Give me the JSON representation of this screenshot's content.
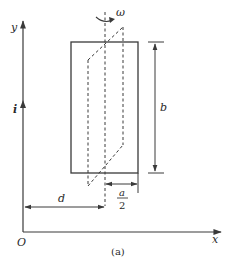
{
  "figure": {
    "caption": "(a)",
    "colors": {
      "stroke": "#3a3a3a",
      "text": "#2a2a2a",
      "background": "#ffffff"
    },
    "axes": {
      "y_label": "y",
      "x_label": "x",
      "origin_label": "O"
    },
    "wire": {
      "current_label": "i",
      "direction": "up"
    },
    "loop": {
      "height_label": "b",
      "half_width_label_num": "a",
      "half_width_label_den": "2",
      "axis_distance_label": "d",
      "rotation_label": "ω",
      "rotated_position": "dashed"
    }
  }
}
